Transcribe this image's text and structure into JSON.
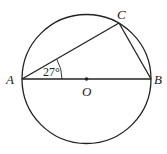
{
  "diagram": {
    "type": "circle-geometry",
    "points": {
      "A": {
        "label": "A",
        "x": 22,
        "y": 79
      },
      "B": {
        "label": "B",
        "x": 151,
        "y": 79
      },
      "C": {
        "label": "C",
        "x": 119,
        "y": 23
      },
      "O": {
        "label": "O",
        "x": 86.5,
        "y": 79
      }
    },
    "circle": {
      "center": "O",
      "radius": 65
    },
    "segments": [
      "AB",
      "AC",
      "CB"
    ],
    "angle": {
      "vertex": "A",
      "value": "27°"
    },
    "colors": {
      "stroke": "#222222",
      "background": "#ffffff"
    }
  }
}
